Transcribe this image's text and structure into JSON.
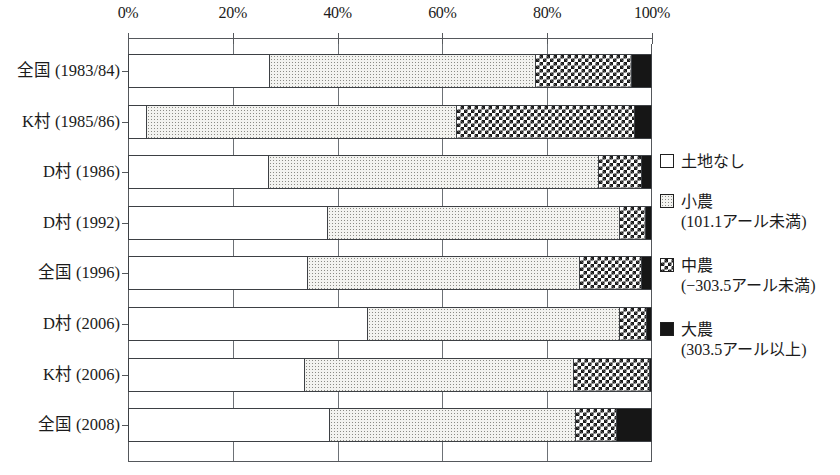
{
  "chart_data": {
    "type": "bar",
    "orientation": "horizontal",
    "stacked": true,
    "normalized_percent": true,
    "title": "",
    "xlabel": "",
    "ylabel": "",
    "xlim": [
      0,
      100
    ],
    "grid": true,
    "legend_position": "right",
    "xticks": [
      {
        "value": 0,
        "label": "0%"
      },
      {
        "value": 20,
        "label": "20%"
      },
      {
        "value": 40,
        "label": "40%"
      },
      {
        "value": 60,
        "label": "60%"
      },
      {
        "value": 80,
        "label": "80%"
      },
      {
        "value": 100,
        "label": "100%"
      }
    ],
    "categories": [
      "全国 (1983/84)",
      "K村 (1985/86)",
      "D村 (1986)",
      "D村 (1992)",
      "全国 (1996)",
      "D村 (2006)",
      "K村 (2006)",
      "全国 (2008)"
    ],
    "series": [
      {
        "name": "土地なし",
        "key": "none",
        "values": [
          26.7,
          3.2,
          26.5,
          37.8,
          34.0,
          45.4,
          33.4,
          38.2
        ]
      },
      {
        "name": "小農",
        "key": "small",
        "values": [
          50.8,
          59.2,
          63.0,
          55.7,
          51.9,
          48.1,
          51.3,
          46.9
        ]
      },
      {
        "name": "中農",
        "key": "medium",
        "values": [
          18.3,
          34.0,
          8.2,
          5.0,
          11.8,
          5.2,
          14.5,
          7.8
        ]
      },
      {
        "name": "大農",
        "key": "large",
        "values": [
          4.2,
          3.6,
          2.3,
          1.5,
          2.3,
          1.3,
          0.8,
          7.1
        ]
      }
    ]
  },
  "legend": {
    "items": [
      {
        "label": "土地なし",
        "sub": "",
        "swatch": "swatch-none"
      },
      {
        "label": "小農",
        "sub": "(101.1アール未満)",
        "swatch": "swatch-small"
      },
      {
        "label": "中農",
        "sub": "(−303.5アール未満)",
        "swatch": "swatch-medium"
      },
      {
        "label": "大農",
        "sub": "(303.5アール以上)",
        "swatch": "swatch-large"
      }
    ]
  }
}
